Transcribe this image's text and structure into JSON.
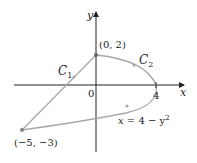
{
  "diagram": {
    "axes": {
      "x_label": "x",
      "y_label": "y",
      "origin_label": "0",
      "x_tick_label": "4"
    },
    "points": {
      "top": "(0, 2)",
      "bottom_left": "(−5, −3)"
    },
    "curves": {
      "c1_label": "C",
      "c1_sub": "1",
      "c2_label": "C",
      "c2_sub": "2",
      "parabola_eq_lhs": "x",
      "parabola_eq_rhs": " = 4 − y",
      "parabola_eq_exp": "2"
    },
    "colors": {
      "curve": "#a8a8a8",
      "axis": "#222222",
      "point": "#888888"
    }
  }
}
